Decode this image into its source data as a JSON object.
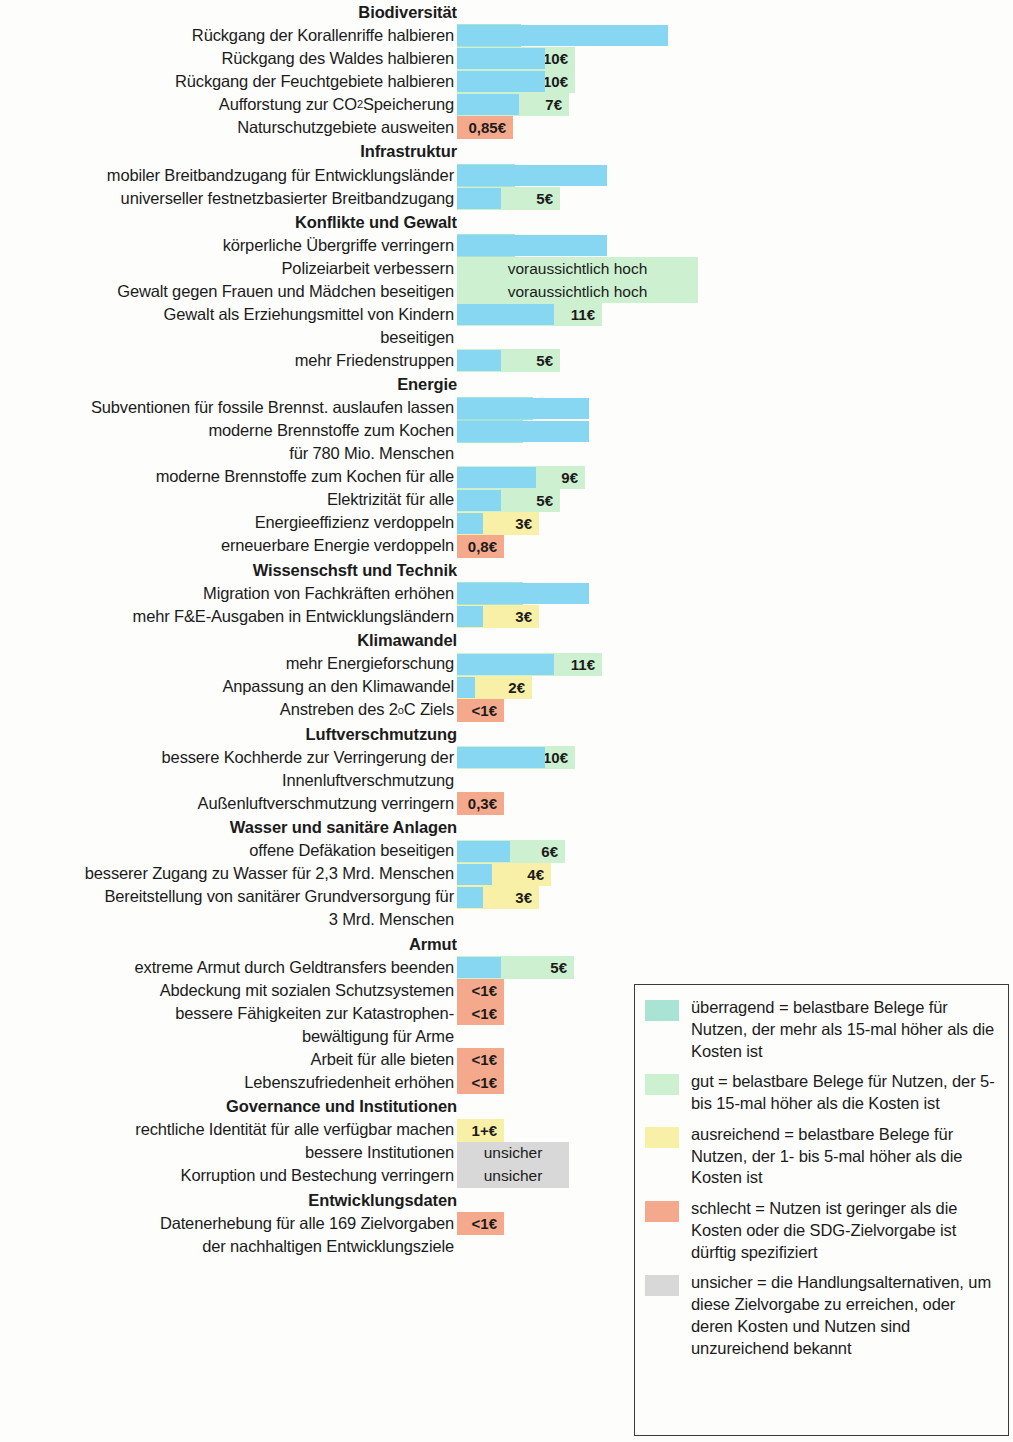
{
  "colors": {
    "bar": "#87d6f2",
    "ueberragend": "#a8e3d4",
    "gut": "#cdf0d0",
    "ausreichend": "#f9f0a8",
    "schlecht": "#f5a98c",
    "unsicher": "#d8d8d8"
  },
  "chart_data": {
    "type": "bar",
    "title": "",
    "xlabel": "",
    "ylabel": "",
    "scale_px_per_euro": 8.8,
    "groups": [
      {
        "name": "Biodiversität",
        "rows": [
          {
            "label": "Rückgang der Korallenriffe halbieren",
            "value_text": "24€",
            "value": 24,
            "rating": "ueberragend",
            "box_w": 64
          },
          {
            "label": "Rückgang des Waldes halbieren",
            "value_text": "10€",
            "value": 10,
            "rating": "gut",
            "box_w": 118
          },
          {
            "label": "Rückgang der Feuchtgebiete halbieren",
            "value_text": "10€",
            "value": 10,
            "rating": "gut",
            "box_w": 118
          },
          {
            "label": "Aufforstung zur CO₂ Speicherung",
            "label_html": "Aufforstung zur CO<sub>2</sub> Speicherung",
            "value_text": "7€",
            "value": 7,
            "rating": "gut",
            "box_w": 112
          },
          {
            "label": "Naturschutzgebiete ausweiten",
            "value_text": "0,85€",
            "value": 0,
            "rating": "schlecht",
            "box_w": 56
          }
        ]
      },
      {
        "name": "Infrastruktur",
        "rows": [
          {
            "label": "mobiler Breitbandzugang für Entwicklungsländer",
            "value_text": "17€",
            "value": 17,
            "rating": "ueberragend",
            "box_w": 58
          },
          {
            "label": "universeller festnetzbasierter Breitbandzugang",
            "value_text": "5€",
            "value": 5,
            "rating": "gut",
            "box_w": 103
          }
        ]
      },
      {
        "name": "Konflikte und Gewalt",
        "rows": [
          {
            "label": "körperliche Übergriffe verringern",
            "value_text": "17€",
            "value": 17,
            "rating": "ueberragend",
            "box_w": 58
          },
          {
            "label": "Polizeiarbeit verbessern",
            "value_text": "voraussichtlich hoch",
            "value": null,
            "rating": "gut",
            "box_w": 241,
            "wide": true
          },
          {
            "label": "Gewalt gegen Frauen und Mädchen beseitigen",
            "value_text": "voraussichtlich hoch",
            "value": null,
            "rating": "gut",
            "box_w": 241,
            "wide": true
          },
          {
            "label": "Gewalt als Erziehungsmittel von Kindern",
            "cont": "beseitigen",
            "value_text": "11€",
            "value": 11,
            "rating": "gut",
            "box_w": 145
          },
          {
            "label": "mehr Friedenstruppen",
            "value_text": "5€",
            "value": 5,
            "rating": "gut",
            "box_w": 103
          }
        ]
      },
      {
        "name": "Energie",
        "rows": [
          {
            "label": "Subventionen für fossile Brennst. auslaufen lassen",
            "value_text": "15 +€",
            "value": 15,
            "rating": "ueberragend",
            "box_w": 76
          },
          {
            "label": "moderne Brennstoffe zum Kochen",
            "cont": "für 780 Mio. Menschen",
            "value_text": "15€",
            "value": 15,
            "rating": "ueberragend",
            "box_w": 66
          },
          {
            "label": "moderne Brennstoffe zum Kochen für alle",
            "value_text": "9€",
            "value": 9,
            "rating": "gut",
            "box_w": 128
          },
          {
            "label": "Elektrizität für alle",
            "value_text": "5€",
            "value": 5,
            "rating": "gut",
            "box_w": 103
          },
          {
            "label": "Energieeffizienz verdoppeln",
            "value_text": "3€",
            "value": 3,
            "rating": "ausreichend",
            "box_w": 82
          },
          {
            "label": "erneuerbare Energie verdoppeln",
            "value_text": "0,8€",
            "value": 0,
            "rating": "schlecht",
            "box_w": 47
          }
        ]
      },
      {
        "name": "Wissenschsft und Technik",
        "rows": [
          {
            "label": "Migration von Fachkräften erhöhen",
            "value_text": "15€",
            "value": 15,
            "rating": "ueberragend",
            "box_w": 66
          },
          {
            "label": "mehr F&E-Ausgaben in Entwicklungsländern",
            "value_text": "3€",
            "value": 3,
            "rating": "ausreichend",
            "box_w": 82
          }
        ]
      },
      {
        "name": "Klimawandel",
        "rows": [
          {
            "label": "mehr Energieforschung",
            "value_text": "11€",
            "value": 11,
            "rating": "gut",
            "box_w": 145
          },
          {
            "label": "Anpassung an den Klimawandel",
            "value_text": "2€",
            "value": 2,
            "rating": "ausreichend",
            "box_w": 75
          },
          {
            "label": "Anstreben des 2°C Ziels",
            "label_html": "Anstreben des 2<sup>o</sup>C Ziels",
            "value_text": "<1€",
            "value": 0,
            "rating": "schlecht",
            "box_w": 47
          }
        ]
      },
      {
        "name": "Luftverschmutzung",
        "rows": [
          {
            "label": "bessere Kochherde zur Verringerung der",
            "cont": "Innenluftverschmutzung",
            "value_text": "10€",
            "value": 10,
            "rating": "gut",
            "box_w": 118
          },
          {
            "label": "Außenluftverschmutzung verringern",
            "value_text": "0,3€",
            "value": 0,
            "rating": "schlecht",
            "box_w": 47
          }
        ]
      },
      {
        "name": "Wasser und sanitäre Anlagen",
        "rows": [
          {
            "label": "offene Defäkation beseitigen",
            "value_text": "6€",
            "value": 6,
            "rating": "gut",
            "box_w": 108
          },
          {
            "label": "besserer Zugang zu Wasser für 2,3 Mrd. Menschen",
            "value_text": "4€",
            "value": 4,
            "rating": "ausreichend",
            "box_w": 94
          },
          {
            "label": "Bereitstellung von sanitärer Grundversorgung für",
            "cont": "3 Mrd. Menschen",
            "value_text": "3€",
            "value": 3,
            "rating": "ausreichend",
            "box_w": 82
          }
        ]
      },
      {
        "name": "Armut",
        "rows": [
          {
            "label": "extreme Armut durch Geldtransfers beenden",
            "value_text": "5€",
            "value": 5,
            "rating": "gut",
            "box_w": 117
          },
          {
            "label": "Abdeckung mit sozialen Schutzsystemen",
            "value_text": "<1€",
            "value": 0,
            "rating": "schlecht",
            "box_w": 47
          },
          {
            "label": "bessere Fähigkeiten zur Katastrophen-",
            "cont": "bewältigung für Arme",
            "value_text": "<1€",
            "value": 0,
            "rating": "schlecht",
            "box_w": 47
          },
          {
            "label": "Arbeit für alle bieten",
            "value_text": "<1€",
            "value": 0,
            "rating": "schlecht",
            "box_w": 47
          },
          {
            "label": "Lebenszufriedenheit erhöhen",
            "value_text": "<1€",
            "value": 0,
            "rating": "schlecht",
            "box_w": 47
          }
        ]
      },
      {
        "name": "Governance und Institutionen",
        "rows": [
          {
            "label": "rechtliche Identität für alle verfügbar machen",
            "value_text": "1+€",
            "value": 0,
            "rating": "ausreichend",
            "box_w": 47
          },
          {
            "label": "bessere Institutionen",
            "value_text": "unsicher",
            "value": null,
            "rating": "unsicher",
            "box_w": 112,
            "wide": true
          },
          {
            "label": "Korruption und Bestechung verringern",
            "value_text": "unsicher",
            "value": null,
            "rating": "unsicher",
            "box_w": 112,
            "wide": true
          }
        ]
      },
      {
        "name": "Entwicklungsdaten",
        "rows": [
          {
            "label": "Datenerhebung für alle 169 Zielvorgaben",
            "cont": "der nachhaltigen Entwicklungsziele",
            "value_text": "<1€",
            "value": 0,
            "rating": "schlecht",
            "box_w": 47
          }
        ]
      }
    ]
  },
  "legend": {
    "items": [
      {
        "rating": "ueberragend",
        "text": "überragend = belastbare Belege für Nutzen, der mehr als 15-mal höher als die Kosten ist"
      },
      {
        "rating": "gut",
        "text": "gut = belastbare Belege für Nutzen, der 5- bis 15-mal höher als die Kosten ist"
      },
      {
        "rating": "ausreichend",
        "text": "ausreichend = belastbare Belege für Nutzen, der 1- bis 5-mal höher als die Kosten ist"
      },
      {
        "rating": "schlecht",
        "text": "schlecht = Nutzen ist geringer als die Kosten oder die SDG-Zielvorgabe ist dürftig spezifiziert"
      },
      {
        "rating": "unsicher",
        "text": "unsicher = die Handlungsalternativen, um diese Zielvorgabe zu erreichen, oder deren Kosten und Nutzen sind unzureichend bekannt"
      }
    ]
  }
}
